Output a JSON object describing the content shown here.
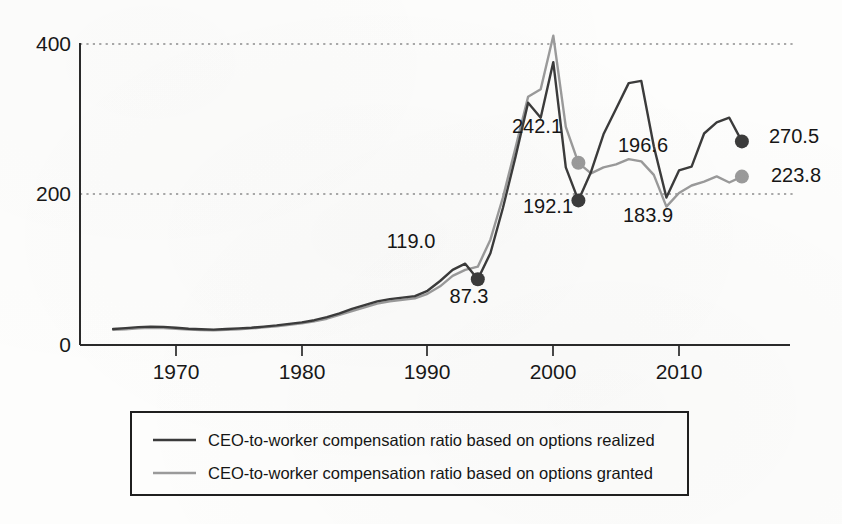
{
  "chart_data": {
    "type": "line",
    "title": "",
    "subtitle": "",
    "xlabel": "",
    "ylabel": "",
    "xlim": [
      1965,
      1920
    ],
    "x_range": [
      1965,
      2015
    ],
    "ylim": [
      0,
      420
    ],
    "grid": "horizontal-dotted",
    "y_ticks": [
      "400",
      "200",
      "0"
    ],
    "y_tick_values": [
      400,
      200,
      0
    ],
    "x_ticks": [
      "1970",
      "1980",
      "1990",
      "2000",
      "2010"
    ],
    "x_tick_values": [
      1970,
      1980,
      1990,
      2000,
      2010
    ],
    "legend_position": "bottom",
    "series": [
      {
        "name": "CEO-to-worker compensation ratio based on options realized",
        "color": "#3b3b3b",
        "x": [
          1965,
          1966,
          1967,
          1968,
          1969,
          1970,
          1971,
          1972,
          1973,
          1974,
          1975,
          1976,
          1977,
          1978,
          1979,
          1980,
          1981,
          1982,
          1983,
          1984,
          1985,
          1986,
          1987,
          1988,
          1989,
          1990,
          1991,
          1992,
          1993,
          1994,
          1995,
          1996,
          1997,
          1998,
          1999,
          2000,
          2001,
          2002,
          2003,
          2004,
          2005,
          2006,
          2007,
          2008,
          2009,
          2010,
          2011,
          2012,
          2013,
          2014,
          2015
        ],
        "values": [
          21.2,
          22.5,
          23.8,
          24.5,
          24.0,
          22.8,
          21.5,
          20.8,
          20.5,
          21.2,
          22.0,
          23.0,
          24.5,
          26.0,
          28.0,
          30.0,
          33.0,
          37.0,
          42.0,
          48.0,
          53.0,
          58.0,
          61.0,
          63.0,
          65.0,
          72.0,
          85.0,
          100.0,
          108.0,
          87.3,
          122.0,
          182.0,
          250.0,
          322.0,
          302.0,
          376.0,
          236.0,
          192.1,
          230.0,
          280.0,
          314.0,
          348.0,
          351.0,
          264.0,
          196.0,
          232.0,
          237.0,
          281.0,
          296.0,
          302.0,
          270.5
        ]
      },
      {
        "name": "CEO-to-worker compensation ratio based on options granted",
        "color": "#9a9a9a",
        "x": [
          1965,
          1966,
          1967,
          1968,
          1969,
          1970,
          1971,
          1972,
          1973,
          1974,
          1975,
          1976,
          1977,
          1978,
          1979,
          1980,
          1981,
          1982,
          1983,
          1984,
          1985,
          1986,
          1987,
          1988,
          1989,
          1990,
          1991,
          1992,
          1993,
          1994,
          1995,
          1996,
          1997,
          1998,
          1999,
          2000,
          2001,
          2002,
          2003,
          2004,
          2005,
          2006,
          2007,
          2008,
          2009,
          2010,
          2011,
          2012,
          2013,
          2014,
          2015
        ],
        "values": [
          20.0,
          21.0,
          22.2,
          23.0,
          22.6,
          21.5,
          20.6,
          19.8,
          19.6,
          20.2,
          21.0,
          22.0,
          23.5,
          25.0,
          27.0,
          29.0,
          31.5,
          35.0,
          40.0,
          45.0,
          50.0,
          55.0,
          58.0,
          60.0,
          62.0,
          68.0,
          78.0,
          92.0,
          100.0,
          104.0,
          140.0,
          196.0,
          262.0,
          330.0,
          340.0,
          411.0,
          290.0,
          242.1,
          228.0,
          236.0,
          240.0,
          247.0,
          244.0,
          226.0,
          183.9,
          202.0,
          212.0,
          217.0,
          224.0,
          216.0,
          223.8
        ]
      }
    ],
    "annotations": [
      {
        "label": "119.0",
        "x": 1992,
        "y": 119.0,
        "marker": "none",
        "series": "options realized"
      },
      {
        "label": "87.3",
        "x": 1994,
        "y": 87.3,
        "marker": "dark-dot",
        "series": "options realized"
      },
      {
        "label": "242.1",
        "x": 2002,
        "y": 242.1,
        "marker": "gray-dot",
        "series": "options granted"
      },
      {
        "label": "192.1",
        "x": 2002,
        "y": 192.1,
        "marker": "dark-dot",
        "series": "options realized"
      },
      {
        "label": "196.6",
        "x": 2007,
        "y": 196.6,
        "marker": "none",
        "series": "options granted"
      },
      {
        "label": "183.9",
        "x": 2009,
        "y": 183.9,
        "marker": "none",
        "series": "options granted"
      },
      {
        "label": "270.5",
        "x": 2015,
        "y": 270.5,
        "marker": "dark-dot",
        "series": "options realized"
      },
      {
        "label": "223.8",
        "x": 2015,
        "y": 223.8,
        "marker": "gray-dot",
        "series": "options granted"
      }
    ]
  },
  "axis": {
    "y_label_400": "400",
    "y_label_200": "200",
    "y_label_0": "0",
    "x_label_1970": "1970",
    "x_label_1980": "1980",
    "x_label_1990": "1990",
    "x_label_2000": "2000",
    "x_label_2010": "2010"
  },
  "values": {
    "v119": "119.0",
    "v87": "87.3",
    "v242": "242.1",
    "v192": "192.1",
    "v196": "196.6",
    "v183": "183.9",
    "v270": "270.5",
    "v223": "223.8"
  },
  "legend": {
    "entries": [
      {
        "label": "CEO-to-worker compensation ratio based on options realized",
        "color": "#3b3b3b"
      },
      {
        "label": "CEO-to-worker compensation ratio based on options granted",
        "color": "#9a9a9a"
      }
    ]
  },
  "colors": {
    "series_realized": "#3b3b3b",
    "series_granted": "#9a9a9a",
    "axis": "#2a2a2a",
    "grid": "#8d8d8d",
    "background": "#fdfdfc"
  }
}
